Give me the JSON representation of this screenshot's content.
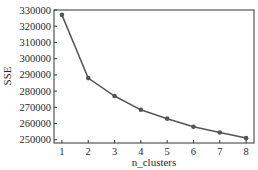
{
  "chart_data": {
    "type": "line",
    "title": "",
    "xlabel": "n_clusters",
    "ylabel": "SSE",
    "x": [
      1,
      2,
      3,
      4,
      5,
      6,
      7,
      8
    ],
    "series": [
      {
        "name": "SSE",
        "values": [
          327000,
          288000,
          277000,
          268500,
          263000,
          258000,
          254500,
          251000
        ]
      }
    ],
    "x_ticks": [
      "1",
      "2",
      "3",
      "4",
      "5",
      "6",
      "7",
      "8"
    ],
    "y_ticks": [
      "250000",
      "260000",
      "270000",
      "280000",
      "290000",
      "300000",
      "310000",
      "320000",
      "330000"
    ],
    "xlim": [
      0.7,
      8.3
    ],
    "ylim": [
      248000,
      330000
    ],
    "grid": false,
    "legend": null,
    "colors": {
      "line": "#555555",
      "marker": "#555555",
      "axis": "#333333"
    }
  }
}
